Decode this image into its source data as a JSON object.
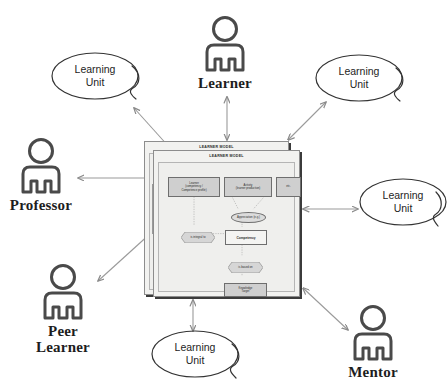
{
  "diagram": {
    "panels": [
      {
        "title": "LEARNER MODEL"
      },
      {
        "title": "LEARNER MODEL"
      }
    ],
    "inner_nodes": [
      {
        "id": "learner-profile",
        "label": "Learner\n(competency /\nCompetence profile)"
      },
      {
        "id": "activity",
        "label": "Activity\n(learner production)"
      },
      {
        "id": "etc",
        "label": "etc."
      },
      {
        "id": "appreciation",
        "label": "Appreciation (e.g.)"
      },
      {
        "id": "is-integral-to",
        "label": "is integral to"
      },
      {
        "id": "competency",
        "label": "Competency"
      },
      {
        "id": "is-based-on",
        "label": "is based on"
      },
      {
        "id": "knowledge-target",
        "label": "Knowledge\nTarget"
      }
    ],
    "connector_labels": [
      "is",
      "is",
      "is",
      "is",
      "is",
      "is"
    ]
  },
  "actors": [
    {
      "id": "learner",
      "label": "Learner",
      "icon": "person-icon"
    },
    {
      "id": "professor",
      "label": "Professor",
      "icon": "person-icon"
    },
    {
      "id": "peer-learner",
      "label": "Peer\nLearner",
      "icon": "person-icon"
    },
    {
      "id": "mentor",
      "label": "Mentor",
      "icon": "person-icon"
    }
  ],
  "learning_units": [
    {
      "id": "lu-topleft",
      "label": "Learning\nUnit"
    },
    {
      "id": "lu-topright",
      "label": "Learning\nUnit"
    },
    {
      "id": "lu-right",
      "label": "Learning\nUnit"
    },
    {
      "id": "lu-bottom",
      "label": "Learning\nUnit"
    }
  ],
  "colors": {
    "background": "#ffffff",
    "stroke": "#6e6e6e",
    "arrow": "#8a8a8a",
    "actor_icon": "#4a4a4a",
    "text": "#1d1d1d",
    "panel_fill": "#f2f2f0",
    "node_fill": "#cfcfcf"
  }
}
